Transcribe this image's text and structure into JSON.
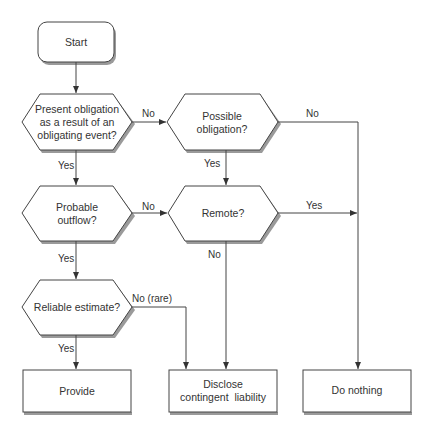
{
  "colors": {
    "stroke": "#444444",
    "shadow": "#9a9a9a",
    "fill": "#ffffff",
    "text": "#333333"
  },
  "nodes": {
    "start": {
      "lines": [
        "Start"
      ]
    },
    "present_obligation": {
      "lines": [
        "Present obligation",
        "as a result of an",
        "obligating event?"
      ]
    },
    "possible_obligation": {
      "lines": [
        "Possible",
        "obligation?"
      ]
    },
    "probable_outflow": {
      "lines": [
        "Probable",
        "outflow?"
      ]
    },
    "remote": {
      "lines": [
        "Remote?"
      ]
    },
    "reliable_estimate": {
      "lines": [
        "Reliable estimate?"
      ]
    },
    "provide": {
      "lines": [
        "Provide"
      ]
    },
    "disclose": {
      "lines": [
        "Disclose",
        "contingent  liability"
      ]
    },
    "do_nothing": {
      "lines": [
        "Do nothing"
      ]
    }
  },
  "edges": {
    "present_no": "No",
    "present_yes": "Yes",
    "possible_no": "No",
    "possible_yes": "Yes",
    "probable_no": "No",
    "probable_yes": "Yes",
    "remote_yes": "Yes",
    "remote_no": "No",
    "reliable_no": "No (rare)",
    "reliable_yes": "Yes"
  }
}
